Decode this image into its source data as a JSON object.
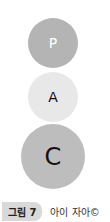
{
  "diagram": {
    "circles": [
      {
        "letter": "P",
        "fill": "#b4b4b4",
        "text_color": "#ffffff"
      },
      {
        "letter": "A",
        "fill": "#e8e8e8",
        "text_color": "#111111"
      },
      {
        "letter": "C",
        "fill": "#bdbdbd",
        "text_color": "#111111"
      }
    ]
  },
  "caption": {
    "label": "그림 7",
    "text": "아이 자아©"
  }
}
